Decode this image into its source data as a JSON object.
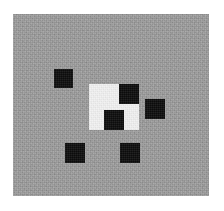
{
  "image": {
    "kind": "abstract-grayscale-pattern",
    "width": 224,
    "height": 211,
    "page_background": "#ffffff"
  },
  "canvas": {
    "name": "gray-noise-field",
    "x": 13,
    "y": 14,
    "width": 196,
    "height": 182,
    "color": "#9c9c9c",
    "texture": "film-grain-noise"
  },
  "white_patch": {
    "name": "white-square-region",
    "x": 89,
    "y": 84,
    "width": 50,
    "height": 46,
    "color": "#f2f2f2"
  },
  "black_squares": [
    {
      "name": "black-square-top-left",
      "x": 54,
      "y": 69,
      "width": 19,
      "height": 19,
      "color": "#131313"
    },
    {
      "name": "black-square-upper-right",
      "x": 119,
      "y": 84,
      "width": 20,
      "height": 20,
      "color": "#131313"
    },
    {
      "name": "black-square-right",
      "x": 145,
      "y": 99,
      "width": 20,
      "height": 20,
      "color": "#131313"
    },
    {
      "name": "black-square-center",
      "x": 104,
      "y": 110,
      "width": 20,
      "height": 20,
      "color": "#131313"
    },
    {
      "name": "black-square-bottom-left",
      "x": 65,
      "y": 143,
      "width": 20,
      "height": 20,
      "color": "#131313"
    },
    {
      "name": "black-square-bottom-middle",
      "x": 120,
      "y": 143,
      "width": 20,
      "height": 20,
      "color": "#131313"
    }
  ]
}
